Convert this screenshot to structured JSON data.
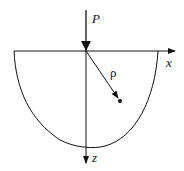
{
  "diagram": {
    "labels": {
      "force": "P",
      "x_axis": "x",
      "z_axis": "z",
      "radius": "ρ"
    },
    "colors": {
      "stroke": "#111111",
      "background": "#ffffff"
    }
  }
}
